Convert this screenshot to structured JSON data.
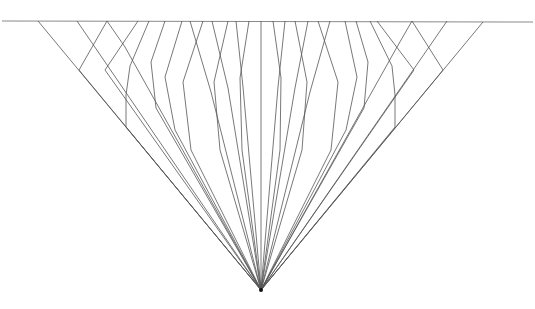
{
  "diagram": {
    "width": 535,
    "height": 309,
    "background": "#ffffff",
    "line_color": "#555555",
    "baseline_color": "#8a8a8a",
    "baseline": {
      "x1": 2,
      "y1": 21,
      "x2": 533,
      "y2": 22
    },
    "apex": {
      "x": 261,
      "y": 290
    },
    "outer_edges": [
      {
        "from": [
          38,
          21
        ],
        "to": [
          261,
          290
        ]
      },
      {
        "from": [
          483,
          22
        ],
        "to": [
          261,
          290
        ]
      }
    ],
    "ray_targets_x": [
      38,
      77,
      107,
      138,
      149,
      165,
      182,
      190,
      203,
      212,
      228,
      236,
      249,
      261,
      273,
      285,
      295,
      308,
      318,
      330,
      345,
      356,
      370,
      377,
      412,
      429,
      447,
      483
    ],
    "polylines": [
      [
        [
          38,
          21
        ],
        [
          261,
          290
        ]
      ],
      [
        [
          77,
          21
        ],
        [
          261,
          290
        ]
      ],
      [
        [
          107,
          21
        ],
        [
          79,
          70
        ],
        [
          261,
          290
        ]
      ],
      [
        [
          107,
          21
        ],
        [
          125,
          47
        ],
        [
          261,
          290
        ]
      ],
      [
        [
          138,
          21
        ],
        [
          105,
          70
        ],
        [
          261,
          290
        ]
      ],
      [
        [
          149,
          21
        ],
        [
          130,
          66
        ],
        [
          126,
          95
        ],
        [
          126,
          127
        ],
        [
          261,
          290
        ]
      ],
      [
        [
          165,
          21
        ],
        [
          151,
          62
        ],
        [
          156,
          108
        ],
        [
          261,
          290
        ]
      ],
      [
        [
          182,
          21
        ],
        [
          165,
          77
        ],
        [
          175,
          130
        ],
        [
          261,
          290
        ]
      ],
      [
        [
          190,
          21
        ],
        [
          211,
          92
        ],
        [
          261,
          290
        ]
      ],
      [
        [
          203,
          21
        ],
        [
          183,
          82
        ],
        [
          191,
          150
        ],
        [
          261,
          290
        ]
      ],
      [
        [
          212,
          21
        ],
        [
          228,
          88
        ],
        [
          261,
          290
        ]
      ],
      [
        [
          228,
          21
        ],
        [
          214,
          82
        ],
        [
          220,
          150
        ],
        [
          261,
          290
        ]
      ],
      [
        [
          236,
          21
        ],
        [
          243,
          87
        ],
        [
          261,
          290
        ]
      ],
      [
        [
          249,
          21
        ],
        [
          240,
          78
        ],
        [
          242,
          150
        ],
        [
          261,
          290
        ]
      ],
      [
        [
          261,
          21
        ],
        [
          261,
          290
        ]
      ],
      [
        [
          273,
          21
        ],
        [
          281,
          78
        ],
        [
          280,
          150
        ],
        [
          261,
          290
        ]
      ],
      [
        [
          285,
          21
        ],
        [
          278,
          87
        ],
        [
          261,
          290
        ]
      ],
      [
        [
          295,
          21
        ],
        [
          307,
          82
        ],
        [
          302,
          150
        ],
        [
          261,
          290
        ]
      ],
      [
        [
          308,
          21
        ],
        [
          295,
          88
        ],
        [
          261,
          290
        ]
      ],
      [
        [
          318,
          21
        ],
        [
          338,
          82
        ],
        [
          331,
          150
        ],
        [
          261,
          290
        ]
      ],
      [
        [
          330,
          21
        ],
        [
          310,
          92
        ],
        [
          261,
          290
        ]
      ],
      [
        [
          345,
          21
        ],
        [
          357,
          77
        ],
        [
          346,
          130
        ],
        [
          261,
          290
        ]
      ],
      [
        [
          356,
          21
        ],
        [
          368,
          62
        ],
        [
          364,
          108
        ],
        [
          261,
          290
        ]
      ],
      [
        [
          370,
          21
        ],
        [
          392,
          66
        ],
        [
          395,
          95
        ],
        [
          395,
          127
        ],
        [
          261,
          290
        ]
      ],
      [
        [
          377,
          21
        ],
        [
          414,
          70
        ],
        [
          261,
          290
        ]
      ],
      [
        [
          412,
          21
        ],
        [
          397,
          47
        ],
        [
          261,
          290
        ]
      ],
      [
        [
          412,
          21
        ],
        [
          443,
          70
        ],
        [
          261,
          290
        ]
      ],
      [
        [
          447,
          21
        ],
        [
          261,
          290
        ]
      ],
      [
        [
          483,
          22
        ],
        [
          261,
          290
        ]
      ]
    ]
  }
}
